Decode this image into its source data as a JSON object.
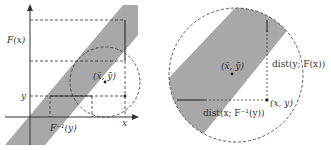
{
  "figure": {
    "left_panel": {
      "labels": {
        "y_axis_tick_Fx": "F(x)",
        "y_axis_tick_y": "y",
        "x_axis_tick_x": "x",
        "x_axis_tick_Finv": "F⁻¹(y)",
        "center_point": "(x̄, ȳ)"
      }
    },
    "right_panel": {
      "labels": {
        "center_point": "(x̄, ȳ)",
        "point_xy": "(x, y)",
        "vertical_distance": "dist(y; F(x))",
        "horizontal_distance": "dist(x; F⁻¹(y))"
      }
    },
    "colors": {
      "band_fill": "#a8a8a8",
      "line": "#333333",
      "background": "#ffffff"
    }
  }
}
